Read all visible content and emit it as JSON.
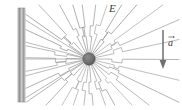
{
  "figure": {
    "background_color": "#ffffff",
    "width": 182,
    "height": 110,
    "labels": {
      "field_label": "E",
      "acceleration_label": "a"
    },
    "wall": {
      "name": "conducting-wall",
      "x": 18,
      "y": 8,
      "width": 7,
      "height": 94,
      "fill_color": "#b8b8b8",
      "edge_color": "#8a8a8a"
    },
    "charge": {
      "name": "point-charge",
      "center_x": 89,
      "center_y": 59,
      "radius": 6.2,
      "fill_color": "#6e6e6e",
      "edge_color": "#4a4a4a"
    },
    "field_lines": {
      "color": "#9a9a9a",
      "stroke_width": 0.7,
      "count": 30,
      "kink_radius_inner": 24,
      "kink_radius_outer": 33,
      "description": "Radial lines from the charge with a kinked shock front at intermediate radius"
    },
    "acceleration_arrow": {
      "name": "acceleration-arrow",
      "x": 163,
      "y_start": 30,
      "y_end": 68,
      "color": "#707070",
      "direction": "down"
    }
  },
  "chart_data": {
    "type": "diagram",
    "elements": [
      {
        "name": "wall",
        "kind": "vertical-bar",
        "x": 18,
        "y0": 8,
        "y1": 102
      },
      {
        "name": "charge",
        "kind": "filled-circle",
        "x": 89,
        "y": 59,
        "r": 6.2
      },
      {
        "name": "field-lines",
        "kind": "radial-kinked-lines",
        "origin": [
          89,
          59
        ],
        "count": 30
      },
      {
        "name": "acceleration-vector",
        "kind": "arrow",
        "from": [
          163,
          30
        ],
        "to": [
          163,
          68
        ]
      }
    ],
    "annotations": [
      {
        "text": "E",
        "x": 109,
        "y": 9
      },
      {
        "text": "a",
        "x": 170,
        "y": 44
      }
    ]
  }
}
